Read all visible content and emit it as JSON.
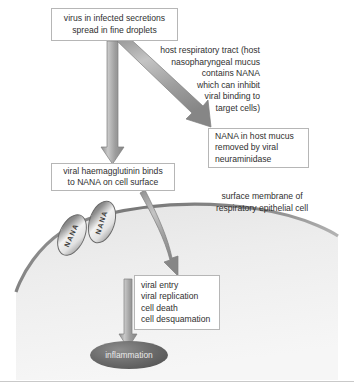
{
  "diagram": {
    "colors": {
      "arrow_fill": "#9d9d9d",
      "arrow_edge": "#7b7b7b",
      "box_border": "#b6b6b6",
      "cell_fill": "#efefef",
      "cell_membrane": "#8c8c8c",
      "inflammation_fill": "#5a5a5a",
      "text": "#2f2f2f",
      "background": "#ffffff"
    },
    "boxes": {
      "virus": {
        "lines": [
          "virus in infected secretions",
          "spread in fine droplets"
        ]
      },
      "nana_mucus": {
        "lines": [
          "NANA in host mucus",
          "removed by viral",
          "neuraminidase"
        ]
      },
      "haemagglutinin": {
        "lines": [
          "viral haemagglutinin binds",
          "to NANA on cell surface"
        ]
      },
      "viral_entry": {
        "lines": [
          "viral entry",
          "viral replication",
          "cell death",
          "cell desquamation"
        ]
      }
    },
    "labels": {
      "host_tract": {
        "lines": [
          "host respiratory tract (host",
          "nasopharyngeal mucus",
          "contains NANA",
          "which can inhibit",
          "viral binding to",
          "target cells)"
        ]
      },
      "surface_membrane": {
        "lines": [
          "surface membrane of",
          "respiratory epithelial cell"
        ]
      }
    },
    "receptors": [
      {
        "name": "nana-receptor-1",
        "label": "NANA"
      },
      {
        "name": "nana-receptor-2",
        "label": "NANA"
      }
    ],
    "outcome": {
      "label": "inflammation"
    },
    "arrows": [
      {
        "name": "arrow-virus-to-haemagglutinin",
        "type": "straight-down"
      },
      {
        "name": "arrow-virus-to-nana-mucus",
        "type": "diagonal-down-right"
      },
      {
        "name": "arrow-haemagglutinin-into-cell",
        "type": "curved-down"
      },
      {
        "name": "arrow-entry-to-inflammation",
        "type": "straight-down"
      }
    ]
  }
}
